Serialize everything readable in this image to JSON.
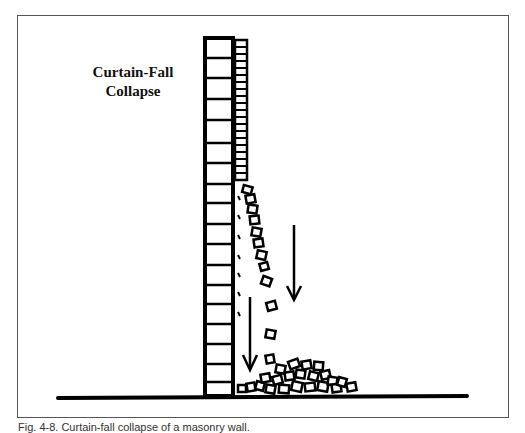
{
  "figure": {
    "title_line1": "Curtain-Fall",
    "title_line2": "Collapse",
    "caption": "Fig. 4-8. Curtain-fall collapse of a masonry wall."
  },
  "elements": {
    "wall": "masonry-wall",
    "arrows": [
      "falling-arrow-left",
      "falling-arrow-right"
    ],
    "ground": "ground-line",
    "debris": "debris-pile"
  },
  "colors": {
    "ink": "#000000",
    "frame": "#555555",
    "background": "#ffffff"
  }
}
